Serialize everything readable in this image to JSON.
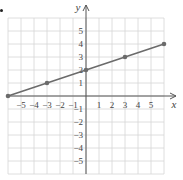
{
  "chart_data": {
    "type": "line",
    "title": "",
    "xlabel": "x",
    "ylabel": "y",
    "xlim": [
      -6,
      6
    ],
    "ylim": [
      -6,
      6
    ],
    "grid": true,
    "x_ticks": [
      -5,
      -4,
      -3,
      -2,
      -1,
      1,
      2,
      3,
      4,
      5
    ],
    "y_ticks": [
      5,
      4,
      3,
      2,
      1,
      -1,
      -2,
      -3,
      -4,
      -5
    ],
    "x_tick_labels": [
      "−5",
      "−4",
      "−3",
      "−2",
      "−1",
      "1",
      "2",
      "3",
      "4",
      "5"
    ],
    "y_tick_labels": [
      "5",
      "4",
      "3",
      "2",
      "1",
      "−1",
      "−2",
      "−3",
      "−4",
      "−5"
    ],
    "series": [
      {
        "name": "line",
        "points": [
          [
            -6,
            0
          ],
          [
            -3,
            1
          ],
          [
            0,
            2
          ],
          [
            3,
            3
          ],
          [
            6,
            4
          ]
        ],
        "color": "#666666"
      }
    ]
  },
  "colors": {
    "grid": "#d6d6d6",
    "axis": "#555555",
    "line": "#6b6b6b",
    "point": "#6b6b6b",
    "text": "#444444"
  }
}
